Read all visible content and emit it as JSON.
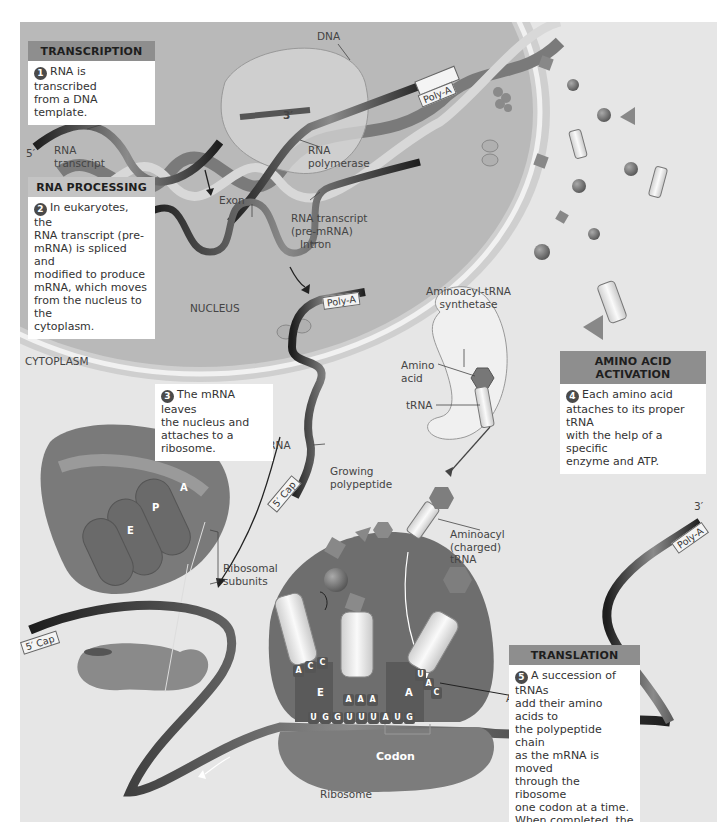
{
  "figure": {
    "regions": {
      "nucleus": "NUCLEUS",
      "cytoplasm": "CYTOPLASM"
    },
    "colors": {
      "panel_bg": "#e6e6e6",
      "nucleus_fill": "#b9b9b9",
      "header_fill": "#8e8e8e",
      "ribosome_fill": "#7a7a7a",
      "mrna_ribbon": "#2a2a2a"
    },
    "steps": [
      {
        "number": "1",
        "header": "TRANSCRIPTION",
        "body": "RNA is transcribed\nfrom a DNA template."
      },
      {
        "number": "2",
        "header": "RNA PROCESSING",
        "body": "In eukaryotes, the\nRNA transcript (pre-\nmRNA) is spliced and\nmodified to produce\nmRNA, which moves\nfrom the nucleus to the\ncytoplasm."
      },
      {
        "number": "3",
        "header": "",
        "body": "The mRNA leaves\nthe nucleus and\nattaches to a ribosome."
      },
      {
        "number": "4",
        "header": "AMINO ACID ACTIVATION",
        "body": "Each amino acid\nattaches to its proper tRNA\nwith the help of a specific\nenzyme and ATP."
      },
      {
        "number": "5",
        "header": "TRANSLATION",
        "body": "A succession of tRNAs\nadd their amino acids to\nthe polypeptide chain\nas the mRNA is moved\nthrough the ribosome\none codon at a time.\nWhen completed, the\npolypeptide is released\nfrom the ribosome."
      }
    ],
    "labels": {
      "dna": "DNA",
      "three_prime_top": "3′",
      "five_prime_top": "5′",
      "rna_transcript": "RNA\ntranscript",
      "rna_polymerase": "RNA\npolymerase",
      "exon": "Exon",
      "rna_transcript_pre": "RNA transcript\n(pre-mRNA)",
      "intron": "Intron",
      "poly_a": "Poly-A",
      "five_cap": "5′ Cap",
      "mrna": "mRNA",
      "aminoacyl_trna_synthetase": "Aminoacyl-tRNA\nsynthetase",
      "amino_acid": "Amino\nacid",
      "trna": "tRNA",
      "growing_polypeptide": "Growing\npolypeptide",
      "aminoacyl_charged_trna": "Aminoacyl\n(charged)\ntRNA",
      "ribosomal_subunits": "Ribosomal\nsubunits",
      "three_prime_bottom": "3′",
      "anticodon": "Anticodon",
      "codon": "Codon",
      "ribosome": "Ribosome"
    },
    "ribosome_sites": {
      "e": "E",
      "p": "P",
      "a": "A"
    },
    "anticodons": {
      "e_site": [
        "A",
        "C",
        "C"
      ],
      "p_site": [
        "A",
        "A",
        "A"
      ],
      "a_site": [
        "U",
        "A",
        "C"
      ]
    },
    "mrna_bases": [
      "U",
      "G",
      "G",
      "U",
      "U",
      "U",
      "A",
      "U",
      "G"
    ]
  }
}
